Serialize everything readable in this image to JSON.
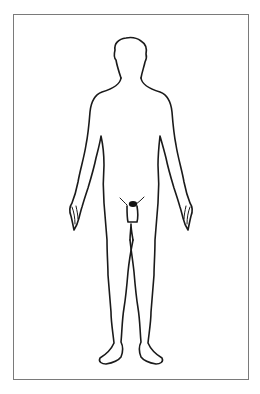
{
  "diagram": {
    "type": "body-outline",
    "view": "front",
    "frame": {
      "border_color": "#7a7a7a",
      "background": "#ffffff"
    },
    "figure": {
      "stroke_color": "#1a1a1a"
    },
    "regions": [
      {
        "id": "head",
        "label": ""
      },
      {
        "id": "neck",
        "label": ""
      },
      {
        "id": "torso",
        "label": ""
      },
      {
        "id": "left-arm",
        "label": ""
      },
      {
        "id": "right-arm",
        "label": ""
      },
      {
        "id": "left-hand",
        "label": ""
      },
      {
        "id": "right-hand",
        "label": ""
      },
      {
        "id": "groin",
        "label": ""
      },
      {
        "id": "left-leg",
        "label": ""
      },
      {
        "id": "right-leg",
        "label": ""
      },
      {
        "id": "left-foot",
        "label": ""
      },
      {
        "id": "right-foot",
        "label": ""
      }
    ]
  }
}
